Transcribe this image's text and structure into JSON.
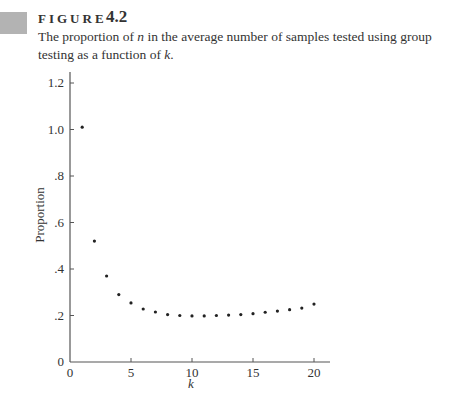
{
  "figure": {
    "label": "FIGURE",
    "number": "4.2",
    "caption_parts": [
      "The proportion of ",
      "n",
      " in the average number of samples tested using group testing as a function of ",
      "k",
      "."
    ]
  },
  "chart_data": {
    "type": "scatter",
    "title": "",
    "xlabel": "k",
    "ylabel": "Proportion",
    "xlim": [
      0,
      21
    ],
    "ylim": [
      0,
      1.25
    ],
    "xticks": [
      0,
      5,
      10,
      15,
      20
    ],
    "xtick_labels": [
      "0",
      "5",
      "10",
      "15",
      "20"
    ],
    "yticks": [
      0,
      0.2,
      0.4,
      0.6,
      0.8,
      1.0,
      1.2
    ],
    "ytick_labels": [
      "0",
      ".2",
      ".4",
      ".6",
      ".8",
      "1.0",
      "1.2"
    ],
    "grid": false,
    "legend": null,
    "x": [
      1,
      2,
      3,
      4,
      5,
      6,
      7,
      8,
      9,
      10,
      11,
      12,
      13,
      14,
      15,
      16,
      17,
      18,
      19,
      20
    ],
    "y": [
      1.01,
      0.52,
      0.37,
      0.29,
      0.254,
      0.228,
      0.215,
      0.204,
      0.2,
      0.198,
      0.198,
      0.2,
      0.202,
      0.204,
      0.208,
      0.214,
      0.219,
      0.225,
      0.232,
      0.249
    ],
    "marker_color": "#222222"
  }
}
